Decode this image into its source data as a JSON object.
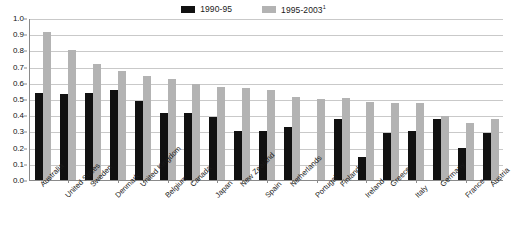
{
  "chart_data": {
    "type": "bar",
    "title": "",
    "subtitle": "",
    "xlabel": "",
    "ylabel": "",
    "ylim": [
      0.0,
      1.0
    ],
    "ytick_step": 0.1,
    "yticks": [
      "1.0",
      "0.9",
      "0.8",
      "0.7",
      "0.6",
      "0.5",
      "0.4",
      "0.3",
      "0.2",
      "0.1",
      "0.0"
    ],
    "grid": true,
    "legend_position": "top-center",
    "categories": [
      "Australia",
      "United States",
      "Sweden",
      "Denmark",
      "United Kingdom",
      "Belgium",
      "Canada",
      "Japan",
      "New Zealand",
      "Spain",
      "Netherlands",
      "Portugal",
      "Finland",
      "Ireland",
      "Greece",
      "Italy",
      "Germany",
      "France",
      "Austria"
    ],
    "series": [
      {
        "name": "1990-95",
        "color": "#111111",
        "values": [
          0.54,
          0.53,
          0.54,
          0.555,
          0.49,
          0.415,
          0.415,
          0.39,
          0.3,
          0.305,
          0.325,
          null,
          0.375,
          0.14,
          0.29,
          0.305,
          0.375,
          0.2,
          0.29
        ]
      },
      {
        "name": "1995-2003",
        "color": "#b3b3b3",
        "footnote_marker": "1",
        "values": [
          0.915,
          0.8,
          0.715,
          0.675,
          0.64,
          0.625,
          0.595,
          0.575,
          0.565,
          0.555,
          0.515,
          0.5,
          0.505,
          0.48,
          0.475,
          0.475,
          0.395,
          0.355,
          0.375
        ]
      }
    ]
  },
  "legend": {
    "items": [
      {
        "label": "1990-95",
        "sup": "",
        "color": "#111111"
      },
      {
        "label": "1995-2003",
        "sup": "1",
        "color": "#b3b3b3"
      }
    ]
  }
}
